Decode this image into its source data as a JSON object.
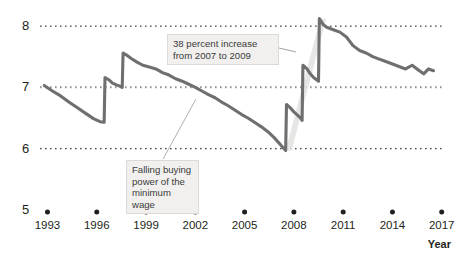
{
  "chart_data": {
    "type": "line",
    "title": "",
    "subtitle": "",
    "xlabel": "Year",
    "ylabel": "",
    "xlim": [
      1992.3,
      2017.2
    ],
    "ylim": [
      5,
      8.2
    ],
    "grid": true,
    "grid_style": "dotted-horizontal",
    "legend": null,
    "y_ticks": [
      "8",
      "7",
      "6",
      "5"
    ],
    "y_tick_values": [
      8,
      7,
      6,
      5
    ],
    "x_ticks": [
      "1993",
      "1996",
      "1999",
      "2002",
      "2005",
      "2008",
      "2011",
      "2014",
      "2017"
    ],
    "x_tick_values": [
      1993,
      1996,
      1999,
      2002,
      2005,
      2008,
      2011,
      2014,
      2017
    ],
    "series": [
      {
        "name": "Real value of the minimum wage",
        "color": "#6f6f6f",
        "x": [
          1992.8,
          1993.3,
          1993.8,
          1994.3,
          1994.8,
          1995.3,
          1995.8,
          1996.2,
          1996.45,
          1996.5,
          1996.75,
          1996.95,
          1997.2,
          1997.4,
          1997.55,
          1997.6,
          1997.85,
          1998.1,
          1998.4,
          1998.8,
          1999.2,
          1999.6,
          2000.0,
          2000.4,
          2000.8,
          2001.2,
          2001.6,
          2002.0,
          2002.4,
          2002.8,
          2003.2,
          2003.6,
          2004.0,
          2004.4,
          2004.8,
          2005.2,
          2005.6,
          2006.0,
          2006.4,
          2006.8,
          2007.2,
          2007.4,
          2007.5,
          2007.55,
          2007.8,
          2008.0,
          2008.2,
          2008.4,
          2008.5,
          2008.55,
          2008.8,
          2009.0,
          2009.2,
          2009.4,
          2009.5,
          2009.55,
          2009.8,
          2010.0,
          2010.4,
          2010.8,
          2011.2,
          2011.6,
          2012.0,
          2012.4,
          2012.8,
          2013.2,
          2013.6,
          2014.0,
          2014.4,
          2014.8,
          2015.2,
          2015.6,
          2015.9,
          2016.2,
          2016.5
        ],
        "y": [
          7.03,
          6.94,
          6.86,
          6.76,
          6.67,
          6.58,
          6.49,
          6.44,
          6.43,
          7.16,
          7.12,
          7.07,
          7.04,
          7.02,
          7.0,
          7.56,
          7.52,
          7.47,
          7.42,
          7.36,
          7.33,
          7.3,
          7.24,
          7.2,
          7.14,
          7.1,
          7.05,
          7.0,
          6.94,
          6.88,
          6.83,
          6.76,
          6.7,
          6.63,
          6.56,
          6.5,
          6.43,
          6.36,
          6.28,
          6.18,
          6.06,
          6.0,
          5.97,
          6.72,
          6.66,
          6.6,
          6.55,
          6.5,
          6.46,
          7.36,
          7.3,
          7.22,
          7.16,
          7.12,
          7.1,
          8.12,
          8.02,
          7.98,
          7.94,
          7.9,
          7.82,
          7.68,
          7.6,
          7.56,
          7.5,
          7.46,
          7.42,
          7.38,
          7.34,
          7.3,
          7.36,
          7.28,
          7.22,
          7.3,
          7.27
        ],
        "start_value": 7.03,
        "end_value": 7.27,
        "min_value": 5.97,
        "max_value": 8.12
      }
    ],
    "annotations": [
      {
        "id": "increase",
        "text": "38 percent increase\nfrom 2007 to 2009",
        "target_x": 2007.9,
        "target_y": 7.05,
        "highlight_band": {
          "from_year": 2007.5,
          "to_year": 2009.6,
          "color": "#e2e2e0"
        }
      },
      {
        "id": "falling",
        "text": "Falling buying\npower of the\nminimum wage",
        "target_x": 2001.6,
        "target_y": 7.05
      }
    ]
  },
  "axis": {
    "year_label": "Year"
  },
  "colors": {
    "line": "#6f6f6f",
    "gridline": "#4a4a4a",
    "callout_bg": "#f1f0ee",
    "callout_border": "#dcdad6",
    "text": "#231f20",
    "highlight_band": "#e2e2e0"
  }
}
